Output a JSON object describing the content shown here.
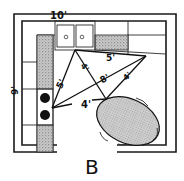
{
  "diagram": {
    "title": "B",
    "type": "kitchen floor plan with work triangle",
    "dimensions": {
      "top_wall": "10'",
      "left_wall": "9'"
    },
    "triangle_labels": {
      "sink_to_fridge": "5'",
      "sink_to_stove": "5'",
      "sink_to_table": "4'",
      "stove_to_fridge": "8'",
      "fridge_to_table": "4'",
      "stove_to_table": "4'"
    },
    "elements": [
      "double sink",
      "counter",
      "cooktop burners",
      "counter",
      "oval table with chairs",
      "door opening"
    ],
    "colors": {
      "line": "#1a1a1a",
      "background": "#ffffff",
      "shade": "#8a8a8a"
    }
  }
}
